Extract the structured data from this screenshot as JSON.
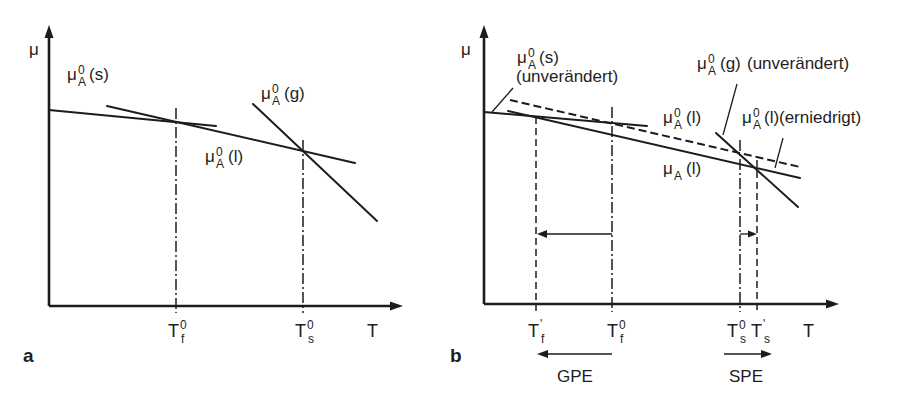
{
  "panel_a": {
    "label": "a",
    "y_axis_label": "μ",
    "x_axis_label": "T",
    "curve_solid": {
      "symbol": "μ",
      "sup": "0",
      "sub": "A",
      "phase": "(s)"
    },
    "curve_gas": {
      "symbol": "μ",
      "sup": "0",
      "sub": "A",
      "phase": "(g)"
    },
    "curve_liquid": {
      "symbol": "μ",
      "sup": "0",
      "sub": "A",
      "phase": "(l)"
    },
    "tick_freezing": {
      "symbol": "T",
      "sup": "0",
      "sub": "f"
    },
    "tick_boiling": {
      "symbol": "T",
      "sup": "0",
      "sub": "s"
    }
  },
  "panel_b": {
    "label": "b",
    "y_axis_label": "μ",
    "x_axis_label": "T",
    "curve_solid": {
      "symbol": "μ",
      "sup": "0",
      "sub": "A",
      "phase": "(s)",
      "note": "(unverändert)"
    },
    "curve_gas": {
      "symbol": "μ",
      "sup": "0",
      "sub": "A",
      "phase": "(g)",
      "note": "(unverändert)"
    },
    "curve_liquid_pure": {
      "symbol": "μ",
      "sup": "0",
      "sub": "A",
      "phase": "(l)"
    },
    "curve_liquid_lowered": {
      "symbol": "μ",
      "sup": "0",
      "sub": "A",
      "phase": "(l)",
      "note": "(erniedrigt)"
    },
    "curve_liquid_solution": {
      "symbol": "μ",
      "sub": "A",
      "phase": "(l)"
    },
    "tick_freezing_new": {
      "symbol": "T",
      "sup": "'",
      "sub": "f"
    },
    "tick_freezing_pure": {
      "symbol": "T",
      "sup": "0",
      "sub": "f"
    },
    "tick_boiling_pure": {
      "symbol": "T",
      "sup": "0",
      "sub": "s"
    },
    "tick_boiling_new": {
      "symbol": "T",
      "sup": "'",
      "sub": "s"
    },
    "gpe_label": "GPE",
    "spe_label": "SPE"
  }
}
